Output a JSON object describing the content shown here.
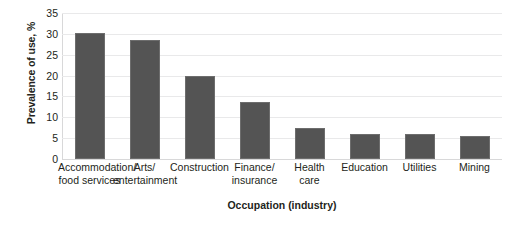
{
  "chart_data": {
    "type": "bar",
    "title": "",
    "subtitle": "",
    "xlabel": "Occupation (industry)",
    "ylabel": "Prevalence of use, %",
    "ylim": [
      0,
      35
    ],
    "yticks": [
      0,
      5,
      10,
      15,
      20,
      25,
      30,
      35
    ],
    "ytick_labels": [
      "0",
      "5",
      "10",
      "15",
      "20",
      "25",
      "30",
      "35"
    ],
    "grid": "horizontal",
    "legend": "none",
    "bar_color": "#545454",
    "bar_edge_color": "#6d6d6d",
    "gridline_color": "#e9e9ea",
    "categories": [
      "Accommodation/\nfood services",
      "Arts/\nentertainment",
      "Construction",
      "Finance/\ninsurance",
      "Health\ncare",
      "Education",
      "Utilities",
      "Mining"
    ],
    "values": [
      30.2,
      28.5,
      19.8,
      13.6,
      7.5,
      6.0,
      6.0,
      5.4
    ]
  }
}
